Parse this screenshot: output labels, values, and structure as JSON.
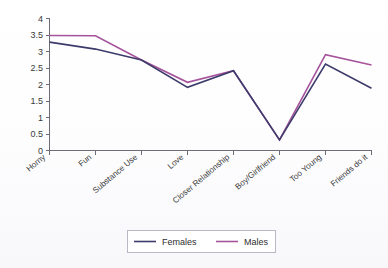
{
  "chart_data": {
    "type": "line",
    "title": "",
    "subtitle": "",
    "xlabel": "",
    "ylabel": "",
    "categories": [
      "Horny",
      "Fun",
      "Substance Use",
      "Love",
      "Closer Relationship",
      "Boy/Girlfriend",
      "Too Young",
      "Friends do it"
    ],
    "series": [
      {
        "name": "Females",
        "color": "#3d3b6b",
        "values": [
          3.26,
          3.05,
          2.72,
          1.9,
          2.4,
          0.32,
          2.6,
          1.87
        ]
      },
      {
        "name": "Males",
        "color": "#a5549b",
        "values": [
          3.46,
          3.45,
          2.72,
          2.05,
          2.4,
          0.32,
          2.88,
          2.57
        ]
      }
    ],
    "ylim": [
      0,
      4
    ],
    "ytick_step": 0.5,
    "ytick_labels": [
      "0",
      "0.5",
      "1",
      "1.5",
      "2",
      "2.5",
      "3",
      "3.5",
      "4"
    ],
    "grid": false,
    "legend_position": "bottom",
    "legend_entries": [
      "Females",
      "Males"
    ]
  },
  "legend": {
    "females_label": "Females",
    "males_label": "Males"
  },
  "colors": {
    "females": "#3d3b6b",
    "males": "#a5549b",
    "axis": "#6d6d7a",
    "text": "#3a3a3a",
    "background": "#fdfdff"
  }
}
